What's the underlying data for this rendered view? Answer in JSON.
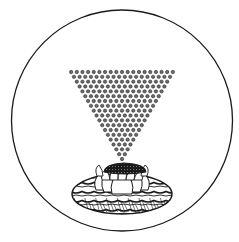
{
  "illustration": {
    "subject": "inverted triangle of dots above a lotus on water, enclosed in a circle",
    "colors": {
      "ink": "#1a1a1a",
      "paper": "#ffffff",
      "dot_fill": "#6a6a6a"
    },
    "triangle": {
      "rows": 19,
      "top_row_dot_count": 19,
      "dots_decrease_per_row": 1,
      "apex_dot_count": 1
    },
    "lotus": {
      "seedpod": "dark stippled",
      "petal_layers": 2
    },
    "water": {
      "style": "hatched waves"
    }
  }
}
